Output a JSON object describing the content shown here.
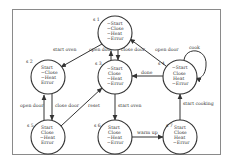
{
  "states": [
    {
      "id": "s 1",
      "cx": 115,
      "cy": 33,
      "props": [
        "~Start",
        "~Close",
        "~Heat",
        "~Error"
      ]
    },
    {
      "id": "s 2",
      "cx": 48,
      "cy": 77,
      "props": [
        "Start",
        "~Close",
        "~Heat",
        "Error"
      ]
    },
    {
      "id": "s 3",
      "cx": 115,
      "cy": 77,
      "props": [
        "~Start",
        "Close",
        "~Heat",
        "~Error"
      ]
    },
    {
      "id": "s 4",
      "cx": 180,
      "cy": 77,
      "props": [
        "~Start",
        "Close",
        "Heat",
        "~Error"
      ]
    },
    {
      "id": "s 5",
      "cx": 48,
      "cy": 137,
      "props": [
        "Start",
        "Close",
        "~Heat",
        "Error"
      ]
    },
    {
      "id": "s 6",
      "cx": 115,
      "cy": 137,
      "props": [
        "Start",
        "Close",
        "~Heat",
        "~Error"
      ]
    },
    {
      "id": "s 7",
      "cx": 180,
      "cy": 137,
      "props": [
        "Start",
        "Close",
        "Heat",
        "~Error"
      ]
    }
  ],
  "edges": [
    {
      "from": "s 1",
      "to": "s 2",
      "label": "start oven"
    },
    {
      "from": "s 3",
      "to": "s 1",
      "label": "open door"
    },
    {
      "from": "s 1",
      "to": "s 3",
      "label": "close door"
    },
    {
      "from": "s 4",
      "to": "s 1",
      "label": "open door"
    },
    {
      "from": "s 4",
      "to": "s 3",
      "label": "done"
    },
    {
      "from": "s 4",
      "to": "s 4",
      "label": "cook"
    },
    {
      "from": "s 5",
      "to": "s 2",
      "label": "open door"
    },
    {
      "from": "s 2",
      "to": "s 5",
      "label": "close door"
    },
    {
      "from": "s 5",
      "to": "s 3",
      "label": "reset"
    },
    {
      "from": "s 3",
      "to": "s 6",
      "label": "start oven"
    },
    {
      "from": "s 6",
      "to": "s 7",
      "label": "warm up"
    },
    {
      "from": "s 7",
      "to": "s 4",
      "label": "start cooking"
    }
  ],
  "labels": {
    "s1": "s 1",
    "s2": "s 2",
    "s3": "s 3",
    "s4": "s 4",
    "s5": "s 5",
    "s6": "s 6",
    "s7": "s 7",
    "e_start_oven_1": "start oven",
    "e_open_door_31": "open door",
    "e_close_door_13": "close door",
    "e_open_door_41": "open door",
    "e_done": "done",
    "e_cook": "cook",
    "e_open_door_52": "open door",
    "e_close_door_25": "close door",
    "e_reset": "reset",
    "e_start_oven_36": "start oven",
    "e_warm_up": "warm up",
    "e_start_cooking": "start cooking"
  },
  "props": {
    "s1": [
      "~Start",
      "~Close",
      "~Heat",
      "~Error"
    ],
    "s2": [
      "Start",
      "~Close",
      "~Heat",
      "Error"
    ],
    "s3": [
      "~Start",
      "Close",
      "~Heat",
      "~Error"
    ],
    "s4": [
      "~Start",
      "Close",
      "Heat",
      "~Error"
    ],
    "s5": [
      "Start",
      "Close",
      "~Heat",
      "Error"
    ],
    "s6": [
      "Start",
      "Close",
      "~Heat",
      "~Error"
    ],
    "s7": [
      "Start",
      "Close",
      "Heat",
      "~Error"
    ]
  }
}
